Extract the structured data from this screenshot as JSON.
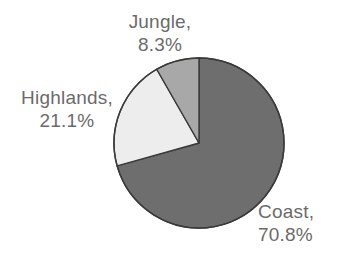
{
  "chart_data": {
    "type": "pie",
    "title": "",
    "categories": [
      "Coast",
      "Highlands",
      "Jungle"
    ],
    "values": [
      70.8,
      21.1,
      8.3
    ],
    "unit": "%",
    "legend": "none",
    "labels_inline": true,
    "start_angle_deg": 0,
    "direction": "clockwise",
    "slices": [
      {
        "name": "Coast",
        "label_name": "Coast,",
        "label_value": "70.8%",
        "value": 70.8,
        "color": "#6e6e6e",
        "start_deg": 0,
        "end_deg": 254.88
      },
      {
        "name": "Highlands",
        "label_name": "Highlands,",
        "label_value": "21.1%",
        "value": 21.1,
        "color": "#ededed",
        "start_deg": 254.88,
        "end_deg": 330.84
      },
      {
        "name": "Jungle",
        "label_name": "Jungle,",
        "label_value": "8.3%",
        "value": 8.3,
        "color": "#a8a8a8",
        "start_deg": 330.84,
        "end_deg": 360
      }
    ],
    "outline_color": "#3a3a3a",
    "text_color": "#6b6b6b",
    "background": "#ffffff",
    "geometry": {
      "center_x": 199,
      "center_y": 143,
      "radius": 85
    }
  }
}
